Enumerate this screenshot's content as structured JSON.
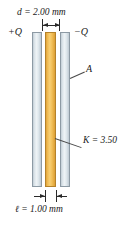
{
  "figure": {
    "type": "parallel-plate-capacitor-with-dielectric",
    "labels": {
      "separation": "d = 2.00 mm",
      "charge_positive": "+Q",
      "charge_negative": "−Q",
      "area": "A",
      "dielectric_constant": "K = 3.50",
      "slab_thickness": "ℓ = 1.00 mm"
    },
    "values": {
      "separation_mm": 2.0,
      "slab_thickness_mm": 1.0,
      "dielectric_constant": 3.5
    },
    "colors": {
      "plate": "#dfe7ec",
      "plate_edge": "#8d9aa4",
      "dielectric": "#f0bc55",
      "dielectric_edge": "#b5822a",
      "line": "#2a2a2a",
      "background": "#ffffff"
    },
    "parts": {
      "plate_left_name": "positively charged plate",
      "plate_right_name": "negatively charged plate",
      "dielectric_name": "dielectric slab"
    }
  }
}
